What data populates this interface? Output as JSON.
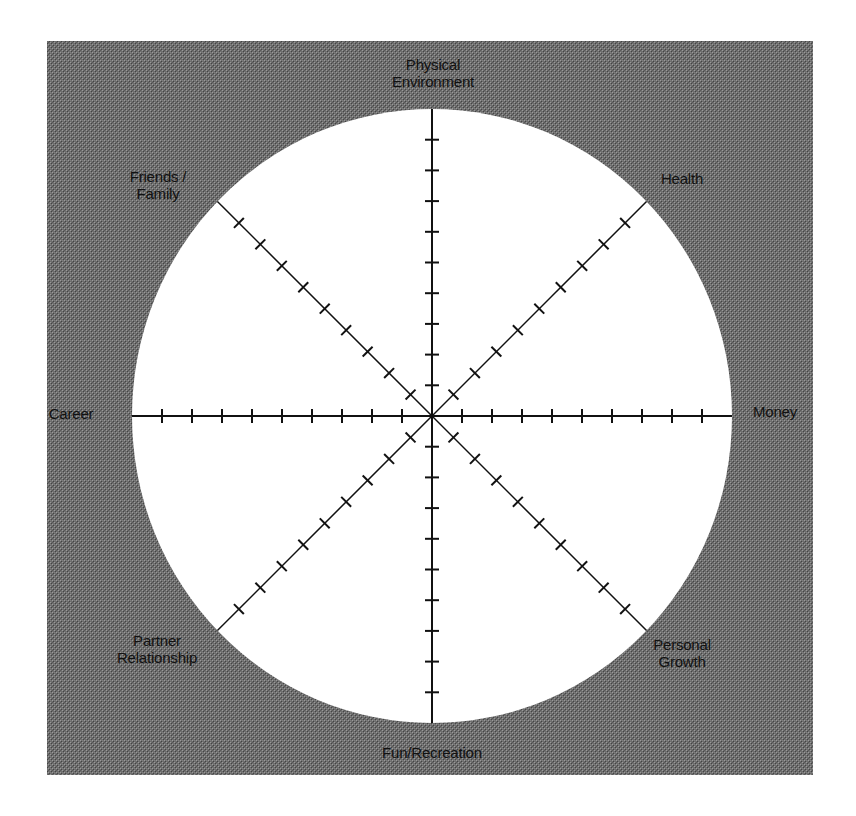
{
  "diagram": {
    "type": "radial-wheel",
    "colors": {
      "background_panel": "#6e6e6e",
      "panel_dither_light": "#8c8c8c",
      "panel_dither_dark": "#4a4a4a",
      "wheel_fill": "#ffffff",
      "spoke": "#111111",
      "label_text": "#111111"
    },
    "ticks_per_spoke": 9,
    "scale_max": 10,
    "segments": [
      {
        "id": "physical-environment",
        "angle": 90,
        "lines": [
          "Physical",
          "Environment"
        ]
      },
      {
        "id": "health",
        "angle": 45,
        "lines": [
          "Health"
        ]
      },
      {
        "id": "money",
        "angle": 0,
        "lines": [
          "Money"
        ]
      },
      {
        "id": "personal-growth",
        "angle": -45,
        "lines": [
          "Personal",
          "Growth"
        ]
      },
      {
        "id": "fun-recreation",
        "angle": -90,
        "lines": [
          "Fun/Recreation"
        ]
      },
      {
        "id": "partner-relationship",
        "angle": -135,
        "lines": [
          "Partner",
          "Relationship"
        ]
      },
      {
        "id": "career",
        "angle": 180,
        "lines": [
          "Career"
        ]
      },
      {
        "id": "friends-family",
        "angle": 135,
        "lines": [
          "Friends /",
          "Family"
        ]
      }
    ]
  }
}
